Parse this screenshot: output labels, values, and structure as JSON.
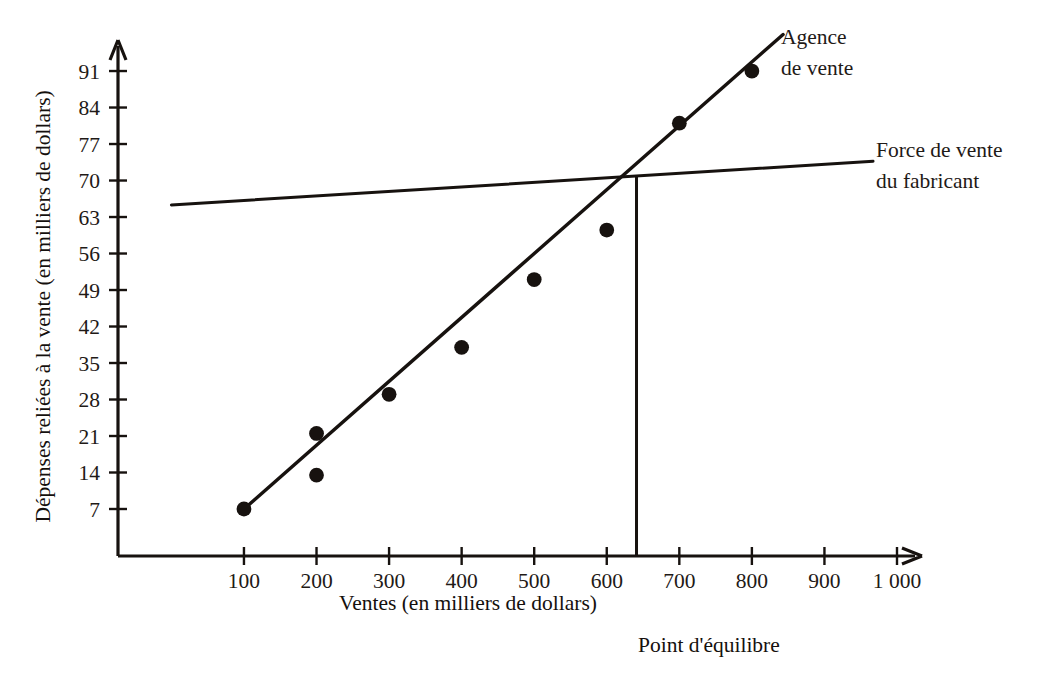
{
  "chart_data": {
    "type": "scatter",
    "title": "",
    "xlabel": "Ventes (en milliers de dollars)",
    "ylabel": "Dépenses reliées à la vente (en milliers de dollars)",
    "xlim": [
      0,
      1050
    ],
    "ylim": [
      0,
      95
    ],
    "grid": false,
    "legend_position": "inline-right",
    "x_ticks": [
      "100",
      "200",
      "300",
      "400",
      "500",
      "600",
      "700",
      "800",
      "900",
      "1 000"
    ],
    "x_tick_values": [
      100,
      200,
      300,
      400,
      500,
      600,
      700,
      800,
      900,
      1000
    ],
    "y_ticks": [
      "7",
      "14",
      "21",
      "28",
      "35",
      "42",
      "49",
      "56",
      "63",
      "70",
      "77",
      "84",
      "91"
    ],
    "y_tick_values": [
      7,
      14,
      21,
      28,
      35,
      42,
      49,
      56,
      63,
      70,
      77,
      84,
      91
    ],
    "series": [
      {
        "name": "Agence de vente",
        "kind": "scatter+line",
        "label": "Agence de vente",
        "label_line1": "Agence",
        "label_line2": "de vente",
        "points": [
          {
            "x": 100,
            "y": 7
          },
          {
            "x": 200,
            "y": 21.5
          },
          {
            "x": 200,
            "y": 13.5
          },
          {
            "x": 300,
            "y": 29
          },
          {
            "x": 400,
            "y": 38
          },
          {
            "x": 500,
            "y": 51
          },
          {
            "x": 600,
            "y": 60.5
          },
          {
            "x": 700,
            "y": 81
          },
          {
            "x": 800,
            "y": 91
          }
        ],
        "fit_line": {
          "x0": 100,
          "y0": 7,
          "x1": 843,
          "y1": 98
        }
      },
      {
        "name": "Force de vente du fabricant",
        "kind": "line",
        "label": "Force de vente du fabricant",
        "label_line1": "Force de vente",
        "label_line2": "du fabricant",
        "fit_line": {
          "x0": 0,
          "y0": 65.3,
          "x1": 967,
          "y1": 73.7
        }
      }
    ],
    "annotations": [
      {
        "name": "break-even",
        "label": "Point d'équilibre",
        "x": 641,
        "y": 71,
        "marker": "vertical-drop-line"
      }
    ]
  },
  "axes": {
    "x_axis_title": "Ventes (en milliers de dollars)",
    "y_axis_title": "Dépenses reliées à la vente (en milliers de dollars)"
  },
  "colors": {
    "ink": "#17120f",
    "background": "#ffffff"
  }
}
